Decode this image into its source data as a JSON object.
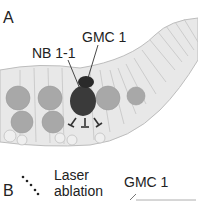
{
  "panel_a": {
    "panel_label": "A",
    "labels": {
      "nb": "NB 1-1",
      "gmc": "GMC 1"
    }
  },
  "panel_b": {
    "panel_label": "B",
    "laser_line1": "Laser",
    "laser_line2": "ablation",
    "gmc": "GMC 1"
  },
  "colors": {
    "nb_cell": "#3a3a3a",
    "gmc_cell": "#2a2a2a",
    "mid_cells": "#a6a6a6",
    "epithelium": "#e6e6e6",
    "outline": "#b8b8b8",
    "leader_line": "#333333"
  }
}
